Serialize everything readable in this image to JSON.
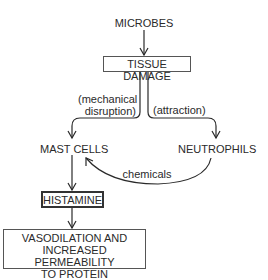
{
  "diagram": {
    "type": "flowchart",
    "nodes": {
      "microbes": "MICROBES",
      "tissue_damage": "TISSUE DAMAGE",
      "mast_cells": "MAST CELLS",
      "neutrophils": "NEUTROPHILS",
      "histamine": "HISTAMINE",
      "outcome_line1": "VASODILATION AND",
      "outcome_line2": "INCREASED PERMEABILITY",
      "outcome_line3": "TO PROTEIN"
    },
    "edge_labels": {
      "mechanical_line1": "(mechanical",
      "mechanical_line2": "disruption)",
      "attraction": "(attraction)",
      "chemicals": "chemicals"
    },
    "edges": [
      {
        "from": "MICROBES",
        "to": "TISSUE DAMAGE"
      },
      {
        "from": "TISSUE DAMAGE",
        "to": "MAST CELLS",
        "label": "(mechanical disruption)"
      },
      {
        "from": "TISSUE DAMAGE",
        "to": "NEUTROPHILS",
        "label": "(attraction)"
      },
      {
        "from": "NEUTROPHILS",
        "to": "MAST CELLS",
        "label": "chemicals"
      },
      {
        "from": "MAST CELLS",
        "to": "HISTAMINE"
      },
      {
        "from": "HISTAMINE",
        "to": "VASODILATION AND INCREASED PERMEABILITY TO PROTEIN"
      }
    ]
  }
}
